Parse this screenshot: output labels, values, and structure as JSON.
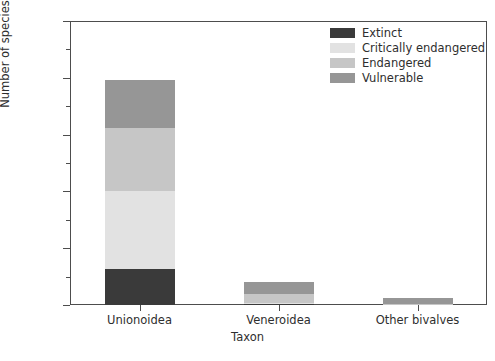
{
  "chart_data": {
    "type": "bar",
    "subtype": "stacked-bar",
    "title": "",
    "xlabel": "Taxon",
    "ylabel": "Number of species",
    "categories": [
      "Unionoidea",
      "Veneroidea",
      "Other bivalves"
    ],
    "ylim": [
      0,
      250
    ],
    "yticks": [
      0,
      50,
      100,
      150,
      200,
      250
    ],
    "ytick_labels": [
      "0",
      "50",
      "100",
      "150",
      "200",
      "250"
    ],
    "yticks_minor": [
      25,
      75,
      125,
      175,
      225
    ],
    "grid": false,
    "legend_position": "top right",
    "stack_order_bottom_to_top": [
      "Extinct",
      "Critically endangered",
      "Endangered",
      "Vulnerable"
    ],
    "series": [
      {
        "name": "Extinct",
        "color": "#3a3a3a",
        "values": [
          32,
          1,
          0
        ]
      },
      {
        "name": "Critically endangered",
        "color": "#e2e2e2",
        "values": [
          68,
          1,
          0
        ]
      },
      {
        "name": "Endangered",
        "color": "#c6c6c6",
        "values": [
          56,
          8,
          1
        ]
      },
      {
        "name": "Vulnerable",
        "color": "#969696",
        "values": [
          42,
          10,
          5
        ]
      }
    ],
    "totals": [
      198,
      20,
      6
    ]
  },
  "legend": {
    "items": [
      {
        "label": "Extinct",
        "color": "#3a3a3a"
      },
      {
        "label": "Critically endangered",
        "color": "#e2e2e2"
      },
      {
        "label": "Endangered",
        "color": "#c6c6c6"
      },
      {
        "label": "Vulnerable",
        "color": "#969696"
      }
    ]
  },
  "axes": {
    "y_label": "Number of species",
    "x_label": "Taxon",
    "y_tick_labels": [
      "250",
      "200",
      "150",
      "100",
      "50",
      "0"
    ],
    "x_tick_labels": [
      "Unionoidea",
      "Veneroidea",
      "Other bivalves"
    ]
  }
}
